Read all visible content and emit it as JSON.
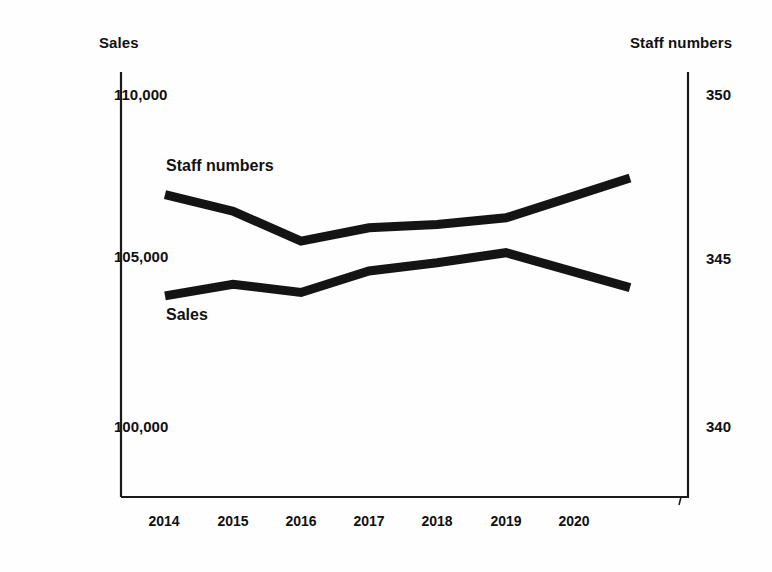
{
  "chart_data": {
    "type": "line",
    "title": "",
    "xlabel": "",
    "categories": [
      "2014",
      "2015",
      "2016",
      "2017",
      "2018",
      "2019",
      "2020"
    ],
    "grid": false,
    "legend_position": "inline-labels",
    "series": [
      {
        "name": "Sales",
        "axis": "left",
        "values": [
          103950,
          104300,
          104050,
          104700,
          104950,
          105250,
          104200
        ]
      },
      {
        "name": "Staff numbers",
        "axis": "right",
        "values": [
          347.0,
          346.5,
          345.6,
          346.0,
          346.1,
          346.3,
          347.5
        ]
      }
    ],
    "left_axis": {
      "label": "Sales",
      "ticks": [
        "110,000",
        "105,000",
        "100,000"
      ],
      "tick_values": [
        110000,
        105000,
        100000
      ],
      "ylim": [
        98000,
        111000
      ]
    },
    "right_axis": {
      "label": "Staff numbers",
      "ticks": [
        "350",
        "345",
        "340"
      ],
      "tick_values": [
        350,
        345,
        340
      ],
      "ylim": [
        338,
        351
      ]
    }
  },
  "labels": {
    "left_axis_title": "Sales",
    "right_axis_title": "Staff numbers",
    "series_sales": "Sales",
    "series_staff": "Staff numbers",
    "y_left_1": "110,000",
    "y_left_2": "105,000",
    "y_left_3": "100,000",
    "y_right_1": "350",
    "y_right_2": "345",
    "y_right_3": "340",
    "x_1": "2014",
    "x_2": "2015",
    "x_3": "2016",
    "x_4": "2017",
    "x_5": "2018",
    "x_6": "2019",
    "x_7": "2020"
  },
  "colors": {
    "line": "#141414",
    "axis": "#1a1a1a",
    "text": "#111111",
    "background": "#fefefe"
  }
}
